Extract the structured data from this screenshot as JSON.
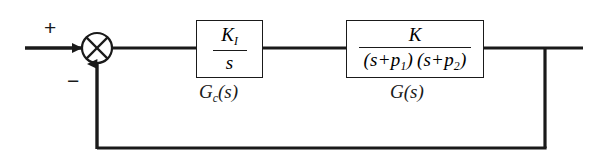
{
  "diagram": {
    "type": "control-system-block-diagram",
    "background_color": "#ffffff",
    "line_color": "#1a1a1a",
    "summing_junction": {
      "name": "summing-junction",
      "style": "circle-with-x-cross",
      "center_x": 97,
      "center_y": 48,
      "radius": 15,
      "input_sign": "+",
      "feedback_sign": "−"
    },
    "blocks": [
      {
        "id": "controller",
        "label": "G",
        "label_subscript": "c",
        "label_suffix": "(s)",
        "numerator": "K",
        "numerator_subscript": "I",
        "denominator": "s",
        "x": 196,
        "y": 20,
        "width": 67,
        "height": 58
      },
      {
        "id": "plant",
        "label": "G",
        "label_subscript": "",
        "label_suffix": "(s)",
        "numerator": "K",
        "denominator_factor_1_prefix": "(s+p",
        "denominator_factor_1_sub": "1",
        "denominator_factor_1_suffix": ")",
        "denominator_factor_2_prefix": "(s+p",
        "denominator_factor_2_sub": "2",
        "denominator_factor_2_suffix": ")",
        "x": 346,
        "y": 20,
        "width": 138,
        "height": 58
      }
    ],
    "signals": {
      "input_label": "+",
      "feedback_label": "−",
      "forward_path_y": 48,
      "feedback_path_y": 148,
      "feedback_takeoff_x": 545,
      "output_end_x": 583,
      "input_start_x": 25
    }
  }
}
